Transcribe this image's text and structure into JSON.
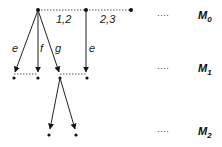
{
  "diagram": {
    "edge_labels": {
      "e_left": "e",
      "f": "f",
      "g": "g",
      "e_right": "e",
      "top_12": "1,2",
      "top_23": "2,3"
    },
    "levels": [
      {
        "ellipsis": "····",
        "name": "M",
        "sub": "0"
      },
      {
        "ellipsis": "····",
        "name": "M",
        "sub": "1"
      },
      {
        "ellipsis": "····",
        "name": "M",
        "sub": "2"
      }
    ],
    "colors": {
      "line": "#222222",
      "dotted": "#555555"
    }
  }
}
